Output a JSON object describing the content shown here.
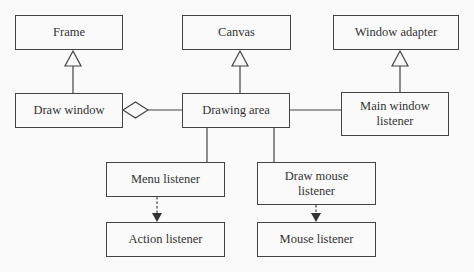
{
  "diagram": {
    "type": "uml-class-diagram",
    "nodes": [
      {
        "id": "frame",
        "label": "Frame",
        "x": 15,
        "y": 15,
        "w": 108,
        "h": 35
      },
      {
        "id": "canvas",
        "label": "Canvas",
        "x": 182,
        "y": 15,
        "w": 109,
        "h": 35
      },
      {
        "id": "window-adapter",
        "label": "Window adapter",
        "x": 333,
        "y": 15,
        "w": 126,
        "h": 35
      },
      {
        "id": "draw-window",
        "label": "Draw window",
        "x": 15,
        "y": 93,
        "w": 108,
        "h": 35
      },
      {
        "id": "drawing-area",
        "label": "Drawing area",
        "x": 182,
        "y": 93,
        "w": 108,
        "h": 35
      },
      {
        "id": "main-window-listener",
        "label": "Main window listener",
        "x": 341,
        "y": 92,
        "w": 108,
        "h": 44
      },
      {
        "id": "menu-listener",
        "label": "Menu listener",
        "x": 106,
        "y": 162,
        "w": 119,
        "h": 35
      },
      {
        "id": "draw-mouse-listener",
        "label": "Draw mouse listener",
        "x": 257,
        "y": 162,
        "w": 119,
        "h": 43
      },
      {
        "id": "action-listener",
        "label": "Action listener",
        "x": 106,
        "y": 222,
        "w": 119,
        "h": 35
      },
      {
        "id": "mouse-listener",
        "label": "Mouse listener",
        "x": 257,
        "y": 222,
        "w": 119,
        "h": 35
      }
    ],
    "edges": [
      {
        "from": "draw-window",
        "to": "frame",
        "kind": "generalization"
      },
      {
        "from": "drawing-area",
        "to": "canvas",
        "kind": "generalization"
      },
      {
        "from": "main-window-listener",
        "to": "window-adapter",
        "kind": "generalization"
      },
      {
        "from": "drawing-area",
        "to": "draw-window",
        "kind": "aggregation"
      },
      {
        "from": "drawing-area",
        "to": "main-window-listener",
        "kind": "association"
      },
      {
        "from": "drawing-area",
        "to": "menu-listener",
        "kind": "association"
      },
      {
        "from": "drawing-area",
        "to": "draw-mouse-listener",
        "kind": "association"
      },
      {
        "from": "menu-listener",
        "to": "action-listener",
        "kind": "realization"
      },
      {
        "from": "draw-mouse-listener",
        "to": "mouse-listener",
        "kind": "realization"
      }
    ]
  }
}
